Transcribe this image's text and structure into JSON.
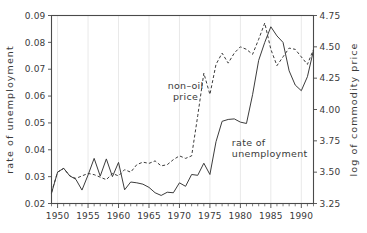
{
  "chart_data": {
    "type": "line",
    "title": "",
    "subtitle": "",
    "xlabel": "",
    "ylabel": "rate of unemployment",
    "y2label": "log of commodity price",
    "xlim": [
      1949,
      1992
    ],
    "ylim": [
      0.02,
      0.09
    ],
    "y2lim": [
      3.25,
      4.75
    ],
    "grid": "vertical-only",
    "legend_position": "inline-annotations",
    "xticks": [
      1950,
      1955,
      1960,
      1965,
      1970,
      1975,
      1980,
      1985,
      1990
    ],
    "xtick_labels": [
      "1950",
      "1955",
      "1960",
      "1965",
      "1970",
      "1975",
      "1980",
      "1985",
      "1990"
    ],
    "xminor_step": 1,
    "yticks": [
      0.02,
      0.03,
      0.04,
      0.05,
      0.06,
      0.07,
      0.08,
      0.09
    ],
    "ytick_labels": [
      "0.02",
      "0.03",
      "0.04",
      "0.05",
      "0.06",
      "0.07",
      "0.08",
      "0.09"
    ],
    "y2ticks": [
      3.25,
      3.5,
      3.75,
      4.0,
      4.25,
      4.5,
      4.75
    ],
    "y2tick_labels": [
      "3.25",
      "3.50",
      "3.75",
      "4.00",
      "4.25",
      "4.50",
      "4.75"
    ],
    "annotations": [
      {
        "text_line1": "non–oil",
        "text_line2": "price",
        "x": 1971.0,
        "y_axis": "left",
        "y": 0.0625
      },
      {
        "text_line1": "rate of",
        "text_line2": "unemployment",
        "x": 1978.6,
        "y_axis": "left",
        "y": 0.0415
      }
    ],
    "series": [
      {
        "name": "rate of unemployment",
        "style": "solid",
        "axis": "left",
        "x": [
          1949,
          1950,
          1951,
          1952,
          1953,
          1954,
          1955,
          1956,
          1957,
          1958,
          1959,
          1960,
          1961,
          1962,
          1963,
          1964,
          1965,
          1966,
          1967,
          1968,
          1969,
          1970,
          1971,
          1972,
          1973,
          1974,
          1975,
          1976,
          1977,
          1978,
          1979,
          1980,
          1981,
          1982,
          1983,
          1984,
          1985,
          1986,
          1987,
          1988,
          1989,
          1990,
          1991,
          1992
        ],
        "values": [
          0.0238,
          0.0317,
          0.0331,
          0.0303,
          0.029,
          0.025,
          0.0306,
          0.0368,
          0.0302,
          0.0366,
          0.03,
          0.0353,
          0.0251,
          0.028,
          0.0277,
          0.0272,
          0.026,
          0.024,
          0.023,
          0.0242,
          0.024,
          0.0277,
          0.0264,
          0.0308,
          0.0305,
          0.035,
          0.0308,
          0.043,
          0.0506,
          0.0513,
          0.0515,
          0.0503,
          0.0498,
          0.0605,
          0.0733,
          0.08,
          0.0858,
          0.0824,
          0.08,
          0.0694,
          0.0641,
          0.062,
          0.0672,
          0.077
        ]
      },
      {
        "name": "non-oil price",
        "style": "dashed",
        "axis": "right",
        "x": [
          1949,
          1950,
          1951,
          1952,
          1953,
          1954,
          1955,
          1956,
          1957,
          1958,
          1959,
          1960,
          1961,
          1962,
          1963,
          1964,
          1965,
          1966,
          1967,
          1968,
          1969,
          1970,
          1971,
          1972,
          1973,
          1974,
          1975,
          1976,
          1977,
          1978,
          1979,
          1980,
          1981,
          1982,
          1983,
          1984,
          1985,
          1986,
          1987,
          1988,
          1989,
          1990,
          1991,
          1992
        ],
        "values": [
          3.34,
          3.5,
          3.53,
          3.47,
          3.45,
          3.47,
          3.49,
          3.48,
          3.46,
          3.44,
          3.49,
          3.47,
          3.52,
          3.5,
          3.56,
          3.58,
          3.57,
          3.59,
          3.55,
          3.56,
          3.6,
          3.63,
          3.61,
          3.63,
          3.95,
          4.29,
          4.12,
          4.36,
          4.45,
          4.37,
          4.45,
          4.5,
          4.48,
          4.44,
          4.56,
          4.69,
          4.48,
          4.35,
          4.42,
          4.49,
          4.48,
          4.42,
          4.36,
          4.48
        ]
      }
    ]
  }
}
